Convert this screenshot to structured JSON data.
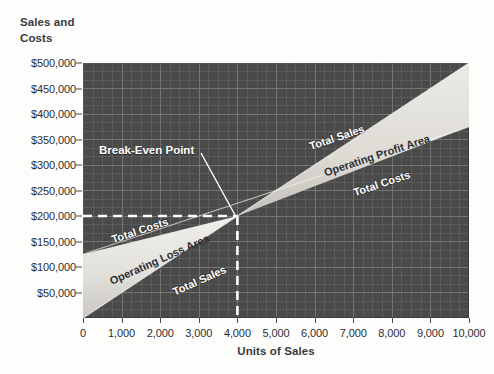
{
  "chart_data": {
    "type": "line",
    "title": "",
    "ylabel": "Sales and Costs",
    "xlabel": "Units of Sales",
    "xlim": [
      0,
      10000
    ],
    "ylim": [
      0,
      500000
    ],
    "grid": true,
    "legend_position": "inline-labels",
    "x_tick_labels": [
      "0",
      "1,000",
      "2,000",
      "3,000",
      "4,000",
      "5,000",
      "6,000",
      "7,000",
      "8,000",
      "9,000",
      "10,000"
    ],
    "x_tick_values": [
      0,
      1000,
      2000,
      3000,
      4000,
      5000,
      6000,
      7000,
      8000,
      9000,
      10000
    ],
    "y_tick_labels": [
      "$50,000",
      "$100,000",
      "$150,000",
      "$200,000",
      "$250,000",
      "$300,000",
      "$350,000",
      "$400,000",
      "$450,000",
      "$500,000"
    ],
    "y_tick_values": [
      50000,
      100000,
      150000,
      200000,
      250000,
      300000,
      350000,
      400000,
      450000,
      500000
    ],
    "series": [
      {
        "name": "Total Sales",
        "x": [
          0,
          10000
        ],
        "values": [
          0,
          500000
        ]
      },
      {
        "name": "Total Costs",
        "x": [
          0,
          10000
        ],
        "values": [
          125000,
          375000
        ]
      }
    ],
    "regions": [
      {
        "name": "Operating Loss Area",
        "label": "Operating Loss Area"
      },
      {
        "name": "Operating Profit Area",
        "label": "Operating Profit Area"
      }
    ],
    "annotations": [
      {
        "name": "break-even-point",
        "label": "Break-Even Point",
        "x": 4000,
        "y": 200000
      }
    ],
    "guide_lines": [
      {
        "name": "break-even-horizontal",
        "orientation": "horizontal",
        "value": 200000,
        "style": "dashed",
        "color": "#ffffff"
      },
      {
        "name": "break-even-vertical",
        "orientation": "vertical",
        "value": 4000,
        "style": "dashed",
        "color": "#ffffff"
      }
    ],
    "colors": {
      "plot_background": "#4a4a4a",
      "grid_line": "#6f6f6f",
      "band_fill": "#e2e0da",
      "band_fill_shadow": "#b9b7b0",
      "guide_line": "#ffffff",
      "axis_text": "#2e2e35",
      "band_label_text": "#ffffff"
    },
    "band_labels": {
      "total_sales_upper": "Total Sales",
      "operating_profit_area": "Operating Profit Area",
      "total_costs_upper": "Total Costs",
      "total_costs_lower": "Total Costs",
      "operating_loss_area": "Operating Loss Area",
      "total_sales_lower": "Total Sales"
    }
  }
}
